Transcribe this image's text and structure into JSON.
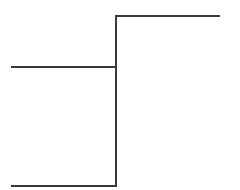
{
  "diagram": {
    "width": 240,
    "height": 190,
    "background": "#ffffff",
    "stroke_color": "#3a3a3a",
    "stroke_width": 2,
    "segments": [
      {
        "name": "vertical-trunk",
        "x1": 116,
        "y1": 16,
        "x2": 116,
        "y2": 186
      },
      {
        "name": "top-right-branch",
        "x1": 116,
        "y1": 16,
        "x2": 219,
        "y2": 16
      },
      {
        "name": "middle-left-branch",
        "x1": 12,
        "y1": 67,
        "x2": 116,
        "y2": 67
      },
      {
        "name": "bottom-left-branch",
        "x1": 12,
        "y1": 186,
        "x2": 116,
        "y2": 186
      }
    ]
  }
}
